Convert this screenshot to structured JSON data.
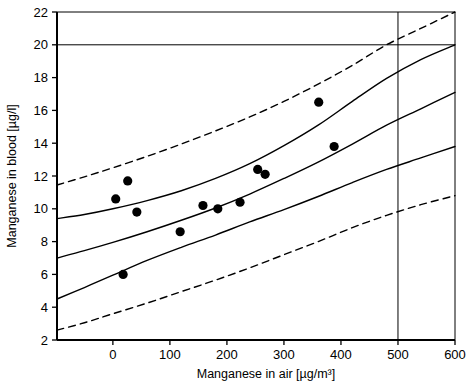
{
  "chart_data": {
    "type": "scatter",
    "title": "",
    "xlabel": "Manganese in air [µg/m³]",
    "ylabel": "Manganese in blood [µg/l]",
    "xlim": [
      -98,
      600
    ],
    "ylim": [
      2,
      22
    ],
    "xticks": [
      0,
      100,
      200,
      300,
      400,
      500,
      600
    ],
    "xtick_labels": [
      "0",
      "100",
      "200",
      "300",
      "400",
      "500",
      "600"
    ],
    "yticks": [
      2,
      4,
      6,
      8,
      10,
      12,
      14,
      16,
      18,
      20,
      22
    ],
    "ytick_labels": [
      "2",
      "4",
      "6",
      "8",
      "10",
      "12",
      "14",
      "16",
      "18",
      "20",
      "22"
    ],
    "grid": false,
    "legend": null,
    "points": [
      {
        "x": 5,
        "y": 10.6
      },
      {
        "x": 26,
        "y": 11.7
      },
      {
        "x": 18,
        "y": 6.0
      },
      {
        "x": 42,
        "y": 9.8
      },
      {
        "x": 118,
        "y": 8.6
      },
      {
        "x": 158,
        "y": 10.2
      },
      {
        "x": 184,
        "y": 10.0
      },
      {
        "x": 223,
        "y": 10.4
      },
      {
        "x": 254,
        "y": 12.4
      },
      {
        "x": 267,
        "y": 12.1
      },
      {
        "x": 361,
        "y": 16.5
      },
      {
        "x": 388,
        "y": 13.8
      }
    ],
    "series": [
      {
        "name": "upper prediction band",
        "style": "dashed",
        "x": [
          -98,
          -50,
          0,
          60,
          120,
          180,
          240,
          300,
          360,
          420,
          480,
          540,
          600
        ],
        "values": [
          11.45,
          11.95,
          12.5,
          13.2,
          13.95,
          14.75,
          15.6,
          16.55,
          17.6,
          18.75,
          20.0,
          21.0,
          22.0
        ]
      },
      {
        "name": "upper confidence band",
        "style": "solid",
        "x": [
          -98,
          -50,
          0,
          60,
          120,
          180,
          240,
          300,
          360,
          420,
          480,
          540,
          600
        ],
        "values": [
          9.4,
          9.65,
          10.0,
          10.5,
          11.1,
          11.85,
          12.75,
          13.85,
          15.1,
          16.55,
          17.95,
          19.1,
          20.0
        ]
      },
      {
        "name": "regression line",
        "style": "solid",
        "x": [
          -98,
          -50,
          0,
          60,
          120,
          180,
          240,
          300,
          360,
          420,
          480,
          540,
          600
        ],
        "values": [
          7.0,
          7.45,
          7.95,
          8.6,
          9.3,
          10.05,
          10.9,
          11.85,
          12.85,
          13.95,
          15.1,
          16.1,
          17.1
        ]
      },
      {
        "name": "lower confidence band",
        "style": "solid",
        "x": [
          -98,
          -50,
          0,
          60,
          120,
          180,
          240,
          300,
          360,
          420,
          480,
          540,
          600
        ],
        "values": [
          4.5,
          5.2,
          5.95,
          6.85,
          7.65,
          8.4,
          9.2,
          9.95,
          10.75,
          11.6,
          12.4,
          13.1,
          13.8
        ]
      },
      {
        "name": "lower prediction band",
        "style": "dashed",
        "x": [
          -98,
          -50,
          0,
          60,
          120,
          180,
          240,
          300,
          360,
          420,
          480,
          540,
          600
        ],
        "values": [
          2.6,
          3.05,
          3.6,
          4.25,
          4.95,
          5.65,
          6.4,
          7.2,
          8.0,
          8.85,
          9.6,
          10.25,
          10.8
        ]
      }
    ],
    "reference_lines": [
      {
        "name": "horizontal-reference-20",
        "orientation": "horizontal",
        "value": 20
      },
      {
        "name": "vertical-reference-500",
        "orientation": "vertical",
        "value": 500
      }
    ],
    "colors": {
      "axis": "#000000",
      "point": "#000000",
      "curve": "#000000",
      "reference": "#000000",
      "background": "#ffffff"
    }
  }
}
